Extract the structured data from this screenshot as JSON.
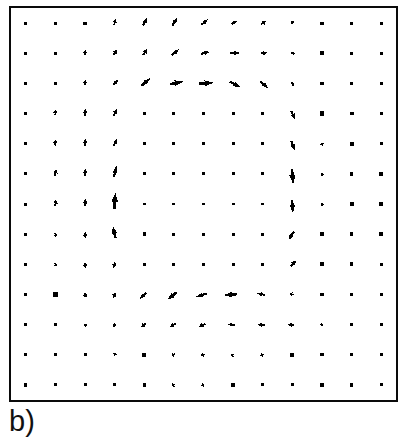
{
  "figure": {
    "panel_label": "b)",
    "plot_type": "quiver",
    "background_color": "#ffffff",
    "arrow_color": "#000000",
    "border_color": "#0a0a0a",
    "grid_columns": 13,
    "grid_rows": 13,
    "grid_visible": false,
    "axis_ticks_visible": false,
    "axis_labels_visible": false
  },
  "chart_data": {
    "type": "scatter",
    "subtype": "quiver",
    "title": "",
    "subtitle": "",
    "xlabel": "",
    "ylabel": "",
    "xlim": [
      0,
      13
    ],
    "ylim": [
      0,
      13
    ],
    "grid": false,
    "legend": null,
    "legend_position": "none",
    "annotations": [
      "b)"
    ],
    "grid_nx": 13,
    "grid_ny": 13,
    "x": [
      1,
      2,
      3,
      4,
      5,
      6,
      7,
      8,
      9,
      10,
      11,
      12,
      13
    ],
    "y": [
      1,
      2,
      3,
      4,
      5,
      6,
      7,
      8,
      9,
      10,
      11,
      12,
      13
    ],
    "magnitude_scale_px_per_unit": 26,
    "max_magnitude": 1.0,
    "vectors": [
      [
        {
          "u": 0.02,
          "v": 0.02,
          "m": 0.03
        },
        {
          "u": 0.01,
          "v": 0.02,
          "m": 0.02
        },
        {
          "u": 0.02,
          "v": 0.03,
          "m": 0.04
        },
        {
          "u": 0.06,
          "v": 0.22,
          "m": 0.23
        },
        {
          "u": 0.16,
          "v": 0.3,
          "m": 0.34
        },
        {
          "u": 0.2,
          "v": 0.3,
          "m": 0.36
        },
        {
          "u": 0.26,
          "v": 0.22,
          "m": 0.34
        },
        {
          "u": 0.22,
          "v": 0.14,
          "m": 0.26
        },
        {
          "u": 0.2,
          "v": 0.14,
          "m": 0.24
        },
        {
          "u": 0.04,
          "v": 0.14,
          "m": 0.15
        },
        {
          "u": 0.03,
          "v": 0.02,
          "m": 0.04
        },
        {
          "u": 0.03,
          "v": 0.01,
          "m": 0.03
        },
        {
          "u": 0.03,
          "v": 0.01,
          "m": 0.03
        }
      ],
      [
        {
          "u": 0.02,
          "v": 0.01,
          "m": 0.02
        },
        {
          "u": 0.01,
          "v": 0.01,
          "m": 0.02
        },
        {
          "u": 0.03,
          "v": 0.18,
          "m": 0.18
        },
        {
          "u": 0.14,
          "v": 0.22,
          "m": 0.26
        },
        {
          "u": 0.14,
          "v": 0.24,
          "m": 0.28
        },
        {
          "u": 0.3,
          "v": 0.22,
          "m": 0.37
        },
        {
          "u": 0.34,
          "v": 0.08,
          "m": 0.35
        },
        {
          "u": 0.4,
          "v": 0.02,
          "m": 0.4
        },
        {
          "u": 0.24,
          "v": 0.04,
          "m": 0.24
        },
        {
          "u": 0.16,
          "v": 0.0,
          "m": 0.16
        },
        {
          "u": 0.07,
          "v": 0.0,
          "m": 0.07
        },
        {
          "u": 0.03,
          "v": 0.0,
          "m": 0.03
        },
        {
          "u": 0.03,
          "v": 0.0,
          "m": 0.03
        }
      ],
      [
        {
          "u": 0.02,
          "v": 0.0,
          "m": 0.02
        },
        {
          "u": 0.03,
          "v": 0.06,
          "m": 0.07
        },
        {
          "u": 0.03,
          "v": 0.2,
          "m": 0.2
        },
        {
          "u": 0.2,
          "v": 0.2,
          "m": 0.28
        },
        {
          "u": 0.34,
          "v": 0.3,
          "m": 0.45
        },
        {
          "u": 0.52,
          "v": 0.1,
          "m": 0.53
        },
        {
          "u": 0.56,
          "v": 0.04,
          "m": 0.56
        },
        {
          "u": 0.42,
          "v": -0.22,
          "m": 0.47
        },
        {
          "u": 0.32,
          "v": -0.28,
          "m": 0.42
        },
        {
          "u": 0.12,
          "v": -0.14,
          "m": 0.18
        },
        {
          "u": 0.05,
          "v": -0.06,
          "m": 0.08
        },
        {
          "u": 0.05,
          "v": -0.02,
          "m": 0.05
        },
        {
          "u": 0.02,
          "v": 0.0,
          "m": 0.02
        }
      ],
      [
        {
          "u": 0.04,
          "v": -0.03,
          "m": 0.05
        },
        {
          "u": 0.03,
          "v": 0.22,
          "m": 0.22
        },
        {
          "u": 0.04,
          "v": 0.26,
          "m": 0.26
        },
        {
          "u": 0.14,
          "v": 0.26,
          "m": 0.3
        },
        {
          "u": 0.04,
          "v": -0.02,
          "m": 0.05
        },
        {
          "u": 0.03,
          "v": -0.02,
          "m": 0.04
        },
        {
          "u": 0.03,
          "v": -0.02,
          "m": 0.04
        },
        {
          "u": 0.03,
          "v": -0.02,
          "m": 0.04
        },
        {
          "u": 0.03,
          "v": -0.02,
          "m": 0.04
        },
        {
          "u": 0.14,
          "v": -0.32,
          "m": 0.35
        },
        {
          "u": 0.04,
          "v": -0.1,
          "m": 0.11
        },
        {
          "u": 0.04,
          "v": -0.08,
          "m": 0.09
        },
        {
          "u": 0.04,
          "v": -0.03,
          "m": 0.05
        }
      ],
      [
        {
          "u": 0.03,
          "v": -0.03,
          "m": 0.04
        },
        {
          "u": 0.03,
          "v": 0.24,
          "m": 0.24
        },
        {
          "u": 0.04,
          "v": 0.3,
          "m": 0.3
        },
        {
          "u": 0.12,
          "v": 0.28,
          "m": 0.31
        },
        {
          "u": 0.04,
          "v": -0.02,
          "m": 0.05
        },
        {
          "u": 0.02,
          "v": -0.01,
          "m": 0.03
        },
        {
          "u": 0.03,
          "v": -0.02,
          "m": 0.04
        },
        {
          "u": 0.03,
          "v": -0.02,
          "m": 0.04
        },
        {
          "u": 0.03,
          "v": -0.02,
          "m": 0.04
        },
        {
          "u": 0.12,
          "v": -0.36,
          "m": 0.38
        },
        {
          "u": 0.04,
          "v": -0.12,
          "m": 0.13
        },
        {
          "u": 0.04,
          "v": -0.08,
          "m": 0.09
        },
        {
          "u": 0.04,
          "v": -0.03,
          "m": 0.05
        }
      ],
      [
        {
          "u": 0.02,
          "v": 0.01,
          "m": 0.03
        },
        {
          "u": 0.03,
          "v": 0.26,
          "m": 0.26
        },
        {
          "u": 0.03,
          "v": 0.3,
          "m": 0.3
        },
        {
          "u": 0.1,
          "v": 0.44,
          "m": 0.45
        },
        {
          "u": 0.02,
          "v": 0.01,
          "m": 0.03
        },
        {
          "u": 0.02,
          "v": 0.0,
          "m": 0.02
        },
        {
          "u": 0.02,
          "v": 0.0,
          "m": 0.02
        },
        {
          "u": 0.02,
          "v": 0.0,
          "m": 0.02
        },
        {
          "u": 0.02,
          "v": 0.0,
          "m": 0.02
        },
        {
          "u": 0.05,
          "v": -0.58,
          "m": 0.58
        },
        {
          "u": 0.05,
          "v": -0.14,
          "m": 0.15
        },
        {
          "u": 0.08,
          "v": -0.02,
          "m": 0.08
        },
        {
          "u": 0.08,
          "v": -0.02,
          "m": 0.08
        }
      ],
      [
        {
          "u": 0.02,
          "v": 0.02,
          "m": 0.03
        },
        {
          "u": 0.03,
          "v": 0.26,
          "m": 0.26
        },
        {
          "u": 0.03,
          "v": 0.3,
          "m": 0.3
        },
        {
          "u": 0.04,
          "v": 0.62,
          "m": 0.62
        },
        {
          "u": 0.02,
          "v": 0.01,
          "m": 0.03
        },
        {
          "u": 0.02,
          "v": 0.0,
          "m": 0.02
        },
        {
          "u": 0.02,
          "v": 0.0,
          "m": 0.02
        },
        {
          "u": 0.02,
          "v": 0.0,
          "m": 0.02
        },
        {
          "u": 0.02,
          "v": 0.0,
          "m": 0.02
        },
        {
          "u": 0.03,
          "v": -0.5,
          "m": 0.5
        },
        {
          "u": 0.06,
          "v": -0.12,
          "m": 0.13
        },
        {
          "u": 0.09,
          "v": -0.01,
          "m": 0.09
        },
        {
          "u": 0.09,
          "v": -0.01,
          "m": 0.09
        }
      ],
      [
        {
          "u": 0.03,
          "v": -0.04,
          "m": 0.05
        },
        {
          "u": 0.04,
          "v": -0.16,
          "m": 0.16
        },
        {
          "u": 0.04,
          "v": -0.2,
          "m": 0.2
        },
        {
          "u": -0.1,
          "v": 0.46,
          "m": 0.47
        },
        {
          "u": 0.04,
          "v": -0.04,
          "m": 0.06
        },
        {
          "u": 0.03,
          "v": -0.02,
          "m": 0.04
        },
        {
          "u": 0.03,
          "v": -0.02,
          "m": 0.04
        },
        {
          "u": 0.03,
          "v": -0.02,
          "m": 0.04
        },
        {
          "u": 0.03,
          "v": -0.02,
          "m": 0.04
        },
        {
          "u": -0.22,
          "v": -0.34,
          "m": 0.41
        },
        {
          "u": 0.05,
          "v": -0.1,
          "m": 0.11
        },
        {
          "u": 0.05,
          "v": -0.06,
          "m": 0.08
        },
        {
          "u": 0.05,
          "v": -0.04,
          "m": 0.06
        }
      ],
      [
        {
          "u": 0.03,
          "v": -0.03,
          "m": 0.04
        },
        {
          "u": 0.04,
          "v": -0.14,
          "m": 0.15
        },
        {
          "u": 0.05,
          "v": -0.2,
          "m": 0.21
        },
        {
          "u": -0.1,
          "v": -0.22,
          "m": 0.24
        },
        {
          "u": 0.04,
          "v": -0.03,
          "m": 0.05
        },
        {
          "u": 0.02,
          "v": -0.01,
          "m": 0.03
        },
        {
          "u": 0.03,
          "v": -0.02,
          "m": 0.04
        },
        {
          "u": 0.03,
          "v": -0.02,
          "m": 0.04
        },
        {
          "u": 0.03,
          "v": -0.02,
          "m": 0.04
        },
        {
          "u": 0.22,
          "v": 0.22,
          "m": 0.31
        },
        {
          "u": 0.06,
          "v": 0.04,
          "m": 0.07
        },
        {
          "u": 0.06,
          "v": 0.04,
          "m": 0.07
        },
        {
          "u": 0.03,
          "v": 0.01,
          "m": 0.03
        }
      ],
      [
        {
          "u": 0.03,
          "v": -0.03,
          "m": 0.04
        },
        {
          "u": 0.05,
          "v": -0.1,
          "m": 0.11
        },
        {
          "u": 0.06,
          "v": -0.18,
          "m": 0.19
        },
        {
          "u": -0.1,
          "v": -0.2,
          "m": 0.22
        },
        {
          "u": -0.26,
          "v": -0.26,
          "m": 0.37
        },
        {
          "u": -0.36,
          "v": -0.3,
          "m": 0.47
        },
        {
          "u": -0.4,
          "v": -0.12,
          "m": 0.42
        },
        {
          "u": -0.52,
          "v": -0.04,
          "m": 0.52
        },
        {
          "u": -0.3,
          "v": 0.06,
          "m": 0.31
        },
        {
          "u": -0.14,
          "v": 0.04,
          "m": 0.15
        },
        {
          "u": -0.06,
          "v": 0.02,
          "m": 0.06
        },
        {
          "u": -0.05,
          "v": 0.01,
          "m": 0.05
        },
        {
          "u": -0.03,
          "v": -0.02,
          "m": 0.04
        }
      ],
      [
        {
          "u": 0.03,
          "v": -0.03,
          "m": 0.04
        },
        {
          "u": 0.02,
          "v": -0.02,
          "m": 0.03
        },
        {
          "u": 0.06,
          "v": -0.12,
          "m": 0.13
        },
        {
          "u": -0.08,
          "v": -0.14,
          "m": 0.16
        },
        {
          "u": -0.18,
          "v": -0.14,
          "m": 0.23
        },
        {
          "u": -0.24,
          "v": -0.14,
          "m": 0.28
        },
        {
          "u": -0.26,
          "v": -0.1,
          "m": 0.28
        },
        {
          "u": -0.3,
          "v": 0.0,
          "m": 0.3
        },
        {
          "u": -0.28,
          "v": 0.0,
          "m": 0.28
        },
        {
          "u": -0.24,
          "v": 0.0,
          "m": 0.24
        },
        {
          "u": -0.12,
          "v": 0.02,
          "m": 0.12
        },
        {
          "u": -0.04,
          "v": 0.03,
          "m": 0.05
        },
        {
          "u": -0.04,
          "v": 0.03,
          "m": 0.05
        }
      ],
      [
        {
          "u": 0.03,
          "v": -0.03,
          "m": 0.04
        },
        {
          "u": 0.01,
          "v": -0.02,
          "m": 0.02
        },
        {
          "u": 0.01,
          "v": -0.02,
          "m": 0.02
        },
        {
          "u": 0.02,
          "v": 0.14,
          "m": 0.14
        },
        {
          "u": -0.08,
          "v": -0.08,
          "m": 0.11
        },
        {
          "u": -0.14,
          "v": -0.08,
          "m": 0.16
        },
        {
          "u": -0.16,
          "v": -0.04,
          "m": 0.16
        },
        {
          "u": -0.14,
          "v": -0.06,
          "m": 0.15
        },
        {
          "u": -0.14,
          "v": -0.06,
          "m": 0.15
        },
        {
          "u": -0.04,
          "v": 0.08,
          "m": 0.09
        },
        {
          "u": -0.04,
          "v": 0.03,
          "m": 0.05
        },
        {
          "u": -0.04,
          "v": 0.03,
          "m": 0.05
        },
        {
          "u": -0.04,
          "v": 0.03,
          "m": 0.05
        }
      ],
      [
        {
          "u": 0.03,
          "v": -0.03,
          "m": 0.04
        },
        {
          "u": 0.01,
          "v": -0.02,
          "m": 0.02
        },
        {
          "u": 0.01,
          "v": -0.02,
          "m": 0.02
        },
        {
          "u": 0.01,
          "v": -0.02,
          "m": 0.02
        },
        {
          "u": -0.03,
          "v": 0.03,
          "m": 0.04
        },
        {
          "u": -0.1,
          "v": -0.06,
          "m": 0.12
        },
        {
          "u": -0.12,
          "v": -0.04,
          "m": 0.13
        },
        {
          "u": -0.05,
          "v": 0.06,
          "m": 0.08
        },
        {
          "u": 0.02,
          "v": 0.0,
          "m": 0.02
        },
        {
          "u": 0.02,
          "v": 0.02,
          "m": 0.03
        },
        {
          "u": -0.04,
          "v": 0.03,
          "m": 0.05
        },
        {
          "u": -0.04,
          "v": 0.03,
          "m": 0.05
        },
        {
          "u": 0.02,
          "v": 0.0,
          "m": 0.02
        }
      ]
    ]
  }
}
